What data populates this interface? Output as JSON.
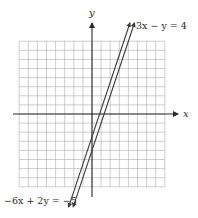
{
  "chart_data": {
    "type": "line",
    "title": "",
    "xlabel": "x",
    "ylabel": "y",
    "xlim": [
      -8,
      8
    ],
    "ylim": [
      -8,
      8
    ],
    "grid": true,
    "grid_step": 1,
    "legend": "none",
    "series": [
      {
        "name": "3x − y = 4",
        "equation": "3x - y = 4",
        "slope": 3,
        "intercept": -4,
        "points": [
          [
            -1.33,
            -8
          ],
          [
            4,
            8
          ]
        ]
      },
      {
        "name": "−6x + 2y = −5",
        "equation": "-6x + 2y = -5",
        "slope": 3,
        "intercept": -2.5,
        "points": [
          [
            -1.83,
            -8
          ],
          [
            3.5,
            8
          ]
        ]
      }
    ],
    "annotations": [
      {
        "text": "3x − y = 4",
        "position": "top-right, near upper end of lines"
      },
      {
        "text": "−6x + 2y = −5",
        "position": "bottom-left, near lower end of lines"
      }
    ]
  },
  "labels": {
    "x_axis": "x",
    "y_axis": "y",
    "eq1": "3x − y = 4",
    "eq2": "−6x + 2y = −5"
  },
  "colors": {
    "grid": "#b8b8b8",
    "axis": "#2a2a2a",
    "line": "#3a3a3a",
    "text": "#2a2a2a"
  }
}
